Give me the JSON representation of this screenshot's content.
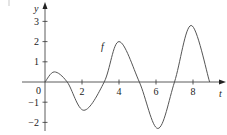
{
  "chart_data": {
    "type": "line",
    "title": "",
    "xlabel": "t",
    "ylabel": "y",
    "curve_label": "f",
    "x_ticks": [
      0,
      2,
      4,
      6,
      8
    ],
    "y_ticks": [
      -2,
      -1,
      1,
      2,
      3
    ],
    "origin_label": "0",
    "xlim": [
      0,
      9.8
    ],
    "ylim": [
      -2.4,
      3.6
    ],
    "grid": false,
    "legend": "none",
    "series": [
      {
        "name": "f",
        "x": [
          0,
          0.5,
          1.2,
          2.1,
          3.2,
          4.0,
          5.1,
          6.1,
          7.0,
          7.9,
          8.9
        ],
        "y": [
          0,
          0.5,
          0,
          -1.4,
          0,
          2.0,
          0,
          -2.3,
          0,
          2.8,
          0
        ]
      }
    ]
  },
  "labels": {
    "x_axis": "t",
    "y_axis": "y",
    "curve": "f",
    "origin": "0",
    "x_tick_labels": [
      "2",
      "4",
      "6",
      "8"
    ],
    "y_tick_labels": [
      "3",
      "2",
      "1",
      "−1",
      "−2"
    ]
  }
}
